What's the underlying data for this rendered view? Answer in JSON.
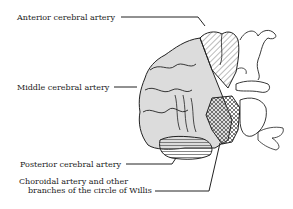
{
  "figure": {
    "labels": {
      "anterior": "Anterior cerebral artery",
      "middle": "Middle cerebral artery",
      "posterior": "Posterior cerebral artery",
      "choroidal_line1": "Choroidal artery and other",
      "choroidal_line2": "branches of the circle of Willis"
    },
    "colors": {
      "line": "#222222",
      "middle_fill": "#dcdcdc",
      "background": "#ffffff"
    }
  }
}
